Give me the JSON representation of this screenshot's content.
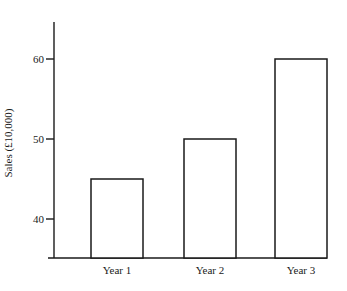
{
  "chart_data": {
    "type": "bar",
    "title": "",
    "xlabel": "",
    "ylabel": "Sales (£10,000)",
    "categories": [
      "Year 1",
      "Year 2",
      "Year 3"
    ],
    "values": [
      45,
      50,
      60
    ],
    "yticks": [
      40,
      50,
      60
    ],
    "ylim": [
      35,
      65
    ],
    "grid": false,
    "legend": null,
    "bar_fill": "#ffffff",
    "bar_stroke": "#1a1a1a"
  }
}
